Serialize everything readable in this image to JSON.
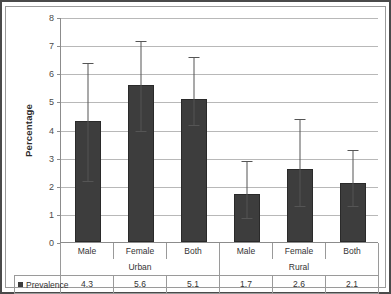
{
  "chart_data": {
    "type": "bar",
    "title": "",
    "xlabel": "",
    "ylabel": "Percentage",
    "ylim": [
      0,
      8
    ],
    "ytick_step": 1,
    "yticks": [
      "8",
      "7",
      "6",
      "5",
      "4",
      "3",
      "2",
      "1",
      "0"
    ],
    "grid": true,
    "legend_position": "bottom-table",
    "categories": [
      "Male",
      "Female",
      "Both",
      "Male",
      "Female",
      "Both"
    ],
    "groups": [
      {
        "label": "Urban",
        "span": 3
      },
      {
        "label": "Rural",
        "span": 3
      }
    ],
    "series": [
      {
        "name": "Prevalence",
        "color": "#3d3d3d",
        "values": [
          4.3,
          5.6,
          5.1,
          1.7,
          2.6,
          2.1
        ],
        "value_labels": [
          "4.3",
          "5.6",
          "5.1",
          "1.7",
          "2.6",
          "2.1"
        ],
        "error_low": [
          2.2,
          4.0,
          4.2,
          0.9,
          1.3,
          1.3
        ],
        "error_high": [
          6.4,
          7.2,
          6.6,
          2.9,
          4.4,
          3.3
        ]
      }
    ]
  },
  "table": {
    "legend_label": "Prevalence",
    "legend_marker": "square-swatch-icon"
  },
  "colors": {
    "bar": "#3d3d3d",
    "gridline": "#b8b8b8",
    "axis": "#8c8c8c",
    "frame": "#4a4a4a",
    "text": "#333333"
  }
}
